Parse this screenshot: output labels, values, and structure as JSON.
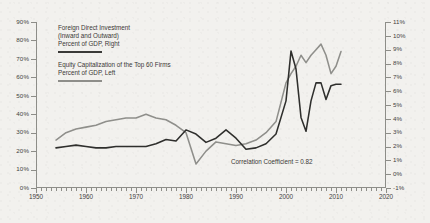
{
  "chart_data": {
    "type": "line",
    "title": "",
    "xlabel": "",
    "ylabel": "",
    "grid": false,
    "legend_position": "upper-left-inside",
    "annotations": [
      {
        "text": "Correlation Coefficient = 0.82",
        "x": 2003,
        "y": 4
      }
    ],
    "x_axis": {
      "min": 1950,
      "max": 2020,
      "tick_labels": [
        "1950",
        "1960",
        "1970",
        "1980",
        "1990",
        "2000",
        "2010",
        "2020"
      ],
      "tick_values": [
        1950,
        1960,
        1970,
        1980,
        1990,
        2000,
        2010,
        2020
      ],
      "minor_tick_step": 1
    },
    "y_axis_left": {
      "label": "Percent of GDP, Left",
      "min": 0,
      "max": 90,
      "tick_labels": [
        "0%",
        "10%",
        "20%",
        "30%",
        "40%",
        "50%",
        "60%",
        "70%",
        "80%",
        "90%"
      ],
      "tick_values": [
        0,
        10,
        20,
        30,
        40,
        50,
        60,
        70,
        80,
        90
      ]
    },
    "y_axis_right": {
      "label": "Percent of GDP, Right",
      "min": -1,
      "max": 11,
      "tick_labels": [
        "-1%",
        "0%",
        "1%",
        "2%",
        "3%",
        "4%",
        "5%",
        "6%",
        "7%",
        "8%",
        "9%",
        "10%",
        "11%"
      ],
      "tick_values": [
        -1,
        0,
        1,
        2,
        3,
        4,
        5,
        6,
        7,
        8,
        9,
        10,
        11
      ]
    },
    "series": [
      {
        "name": "Foreign Direct Investment (Inward and Outward)",
        "axis": "right",
        "color": "#2f2f2d",
        "x": [
          1954,
          1956,
          1958,
          1960,
          1962,
          1964,
          1966,
          1968,
          1970,
          1972,
          1974,
          1976,
          1978,
          1980,
          1982,
          1984,
          1986,
          1988,
          1990,
          1992,
          1994,
          1996,
          1998,
          2000,
          2001,
          2002,
          2003,
          2004,
          2005,
          2006,
          2007,
          2008,
          2009,
          2010,
          2011
        ],
        "values": [
          1.9,
          2.0,
          2.1,
          2.0,
          1.9,
          1.9,
          2.0,
          2.0,
          2.0,
          2.0,
          2.2,
          2.5,
          2.4,
          3.2,
          2.9,
          2.3,
          2.6,
          3.2,
          2.6,
          1.8,
          1.9,
          2.2,
          2.9,
          5.3,
          8.9,
          7.6,
          4.1,
          3.1,
          5.3,
          6.6,
          6.6,
          5.4,
          6.4,
          6.5,
          6.5
        ]
      },
      {
        "name": "Equity Capitalization of the Top 60 Firms",
        "axis": "left",
        "color": "#8f8f8b",
        "x": [
          1954,
          1956,
          1958,
          1960,
          1962,
          1964,
          1966,
          1968,
          1970,
          1972,
          1974,
          1976,
          1978,
          1980,
          1982,
          1984,
          1986,
          1988,
          1990,
          1992,
          1994,
          1996,
          1998,
          2000,
          2001,
          2002,
          2003,
          2004,
          2005,
          2006,
          2007,
          2008,
          2009,
          2010,
          2011
        ],
        "values": [
          26,
          30,
          32,
          33,
          34,
          36,
          37,
          38,
          38,
          40,
          38,
          37,
          34,
          30,
          13,
          20,
          25,
          24,
          23,
          24,
          26,
          30,
          36,
          57,
          62,
          66,
          72,
          68,
          72,
          75,
          78,
          72,
          62,
          66,
          74
        ]
      }
    ]
  },
  "legend": {
    "items": [
      {
        "lines": [
          "Foreign Direct Investment",
          "(Inward and Outward)",
          "Percent of GDP, Right"
        ],
        "swatch_color": "#3a3a38"
      },
      {
        "lines": [
          "Equity Capitalization of the Top 60 Firms",
          "Percent of GDP, Left"
        ],
        "swatch_color": "#8e8e8a"
      }
    ]
  },
  "annotation": {
    "correlation": "Correlation Coefficient = 0.82"
  }
}
